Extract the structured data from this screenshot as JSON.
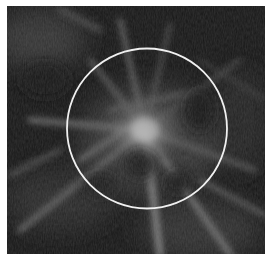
{
  "image": {
    "subject": "mammogram-tissue",
    "background_color": "#151515",
    "border_color": "#ffffff",
    "annotation": {
      "shape": "circle",
      "color": "#f2f2f2",
      "center_x": 147,
      "center_y": 128,
      "radius": 80
    }
  }
}
